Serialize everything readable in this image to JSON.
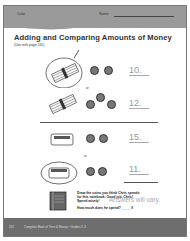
{
  "header": {
    "color_label": "Color",
    "name_label": "Name"
  },
  "title": "Adding and Comparing Amounts of Money",
  "subtitle": "(Use with page 261)",
  "problems": [
    {
      "id": 1,
      "items": "bundle of pencils, 2 coins",
      "answer": "10.",
      "circled": true
    },
    {
      "id": 2,
      "items": "bundle of pencils, 3 coins",
      "answer": "12.",
      "circled": false
    },
    {
      "id": 3,
      "items": "eraser, 2 coins",
      "answer": "15.",
      "circled": false
    },
    {
      "id": 4,
      "items": "eraser, 2 coins",
      "answer": "11.",
      "circled": true
    }
  ],
  "or_label": "or",
  "instruction": {
    "line1": "Draw the coins you think Chris spends",
    "line2": "for this notebook. Good job, Chris!",
    "line3": "Spend wisely!",
    "line4": "How much does he spend? _____¢",
    "handwritten": "Answers will vary."
  },
  "footer": {
    "page_number": "262",
    "text": "Complete Book of Time & Money • Grades K-3"
  }
}
